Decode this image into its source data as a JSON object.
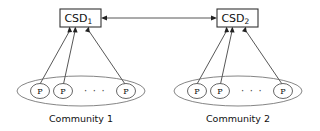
{
  "figure": {
    "type": "diagram",
    "background_color": "#ffffff",
    "line_color": "#555555",
    "text_color": "#111111"
  },
  "directories": [
    {
      "id": "csd1",
      "label": "CSD",
      "subscript": "1",
      "x": 60,
      "y": 9,
      "width": 41,
      "height": 18
    },
    {
      "id": "csd2",
      "label": "CSD",
      "subscript": "2",
      "x": 217,
      "y": 9,
      "width": 41,
      "height": 18
    }
  ],
  "inter_directory_link": {
    "from": "csd1",
    "to": "csd2",
    "direction": "bidirectional",
    "x1": 101,
    "x2": 217,
    "y": 18
  },
  "communities": [
    {
      "id": "community1",
      "caption": "Community 1",
      "caption_x": 81,
      "caption_y": 122,
      "ellipse": {
        "cx": 81,
        "cy": 91,
        "rx": 64,
        "ry": 15
      },
      "directory": "csd1",
      "peers": [
        {
          "label": "P",
          "cx": 40,
          "cy": 91,
          "rx": 9.5,
          "ry": 7.5
        },
        {
          "label": "P",
          "cx": 63,
          "cy": 91,
          "rx": 9.5,
          "ry": 7.5
        },
        {
          "label": "P",
          "cx": 126,
          "cy": 91,
          "rx": 9.5,
          "ry": 7.5
        }
      ],
      "ellipsis": {
        "text": "· · ·",
        "x": 95,
        "y": 93
      }
    },
    {
      "id": "community2",
      "caption": "Community 2",
      "caption_x": 238,
      "caption_y": 122,
      "ellipse": {
        "cx": 238,
        "cy": 91,
        "rx": 64,
        "ry": 15
      },
      "directory": "csd2",
      "peers": [
        {
          "label": "P",
          "cx": 197,
          "cy": 91,
          "rx": 9.5,
          "ry": 7.5
        },
        {
          "label": "P",
          "cx": 220,
          "cy": 91,
          "rx": 9.5,
          "ry": 7.5
        },
        {
          "label": "P",
          "cx": 283,
          "cy": 91,
          "rx": 9.5,
          "ry": 7.5
        }
      ],
      "ellipsis": {
        "text": "· · ·",
        "x": 252,
        "y": 93
      }
    }
  ]
}
